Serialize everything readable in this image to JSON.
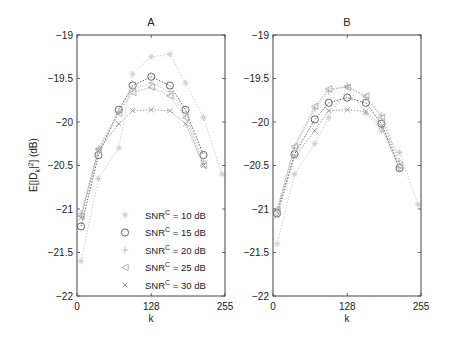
{
  "chart_data": [
    {
      "type": "line",
      "title": "A",
      "xlabel": "k",
      "ylabel": "E[|D_k|^2] (dB)",
      "xlim": [
        0,
        255
      ],
      "ylim": [
        -22,
        -19
      ],
      "xticks": [
        "0",
        "128",
        "255"
      ],
      "yticks": [
        "-19",
        "-19.5",
        "-20",
        "-20.5",
        "-21",
        "-21.5",
        "-22"
      ],
      "grid": false,
      "legend_position": "lower center",
      "series": [
        {
          "name": "SNR^C = 10 dB",
          "marker": "asterisk",
          "color": "#c8c8c8",
          "x": [
            7,
            37,
            72,
            96,
            128,
            160,
            187,
            218,
            250
          ],
          "y": [
            -21.6,
            -20.65,
            -20.3,
            -19.45,
            -19.25,
            -19.22,
            -19.55,
            -19.95,
            -20.6
          ]
        },
        {
          "name": "SNR^C = 15 dB",
          "marker": "circle",
          "color": "#555555",
          "x": [
            7,
            37,
            72,
            96,
            128,
            160,
            187,
            218
          ],
          "y": [
            -21.2,
            -20.38,
            -19.86,
            -19.58,
            -19.48,
            -19.58,
            -19.86,
            -20.38
          ]
        },
        {
          "name": "SNR^C = 20 dB",
          "marker": "plus",
          "color": "#bbbbbb",
          "x": [
            7,
            37,
            72,
            96,
            128,
            160,
            187,
            218
          ],
          "y": [
            -21.05,
            -20.3,
            -19.88,
            -19.62,
            -19.55,
            -19.65,
            -19.9,
            -20.45
          ]
        },
        {
          "name": "SNR^C = 25 dB",
          "marker": "triangle-left",
          "color": "#aaaaaa",
          "x": [
            7,
            37,
            72,
            96,
            128,
            160,
            187,
            218
          ],
          "y": [
            -21.08,
            -20.32,
            -19.9,
            -19.66,
            -19.6,
            -19.7,
            -19.95,
            -20.5
          ]
        },
        {
          "name": "SNR^C = 30 dB",
          "marker": "x",
          "color": "#999999",
          "x": [
            7,
            37,
            72,
            96,
            128,
            160,
            187,
            218
          ],
          "y": [
            -21.1,
            -20.33,
            -20.02,
            -19.87,
            -19.86,
            -19.87,
            -20.02,
            -20.5
          ]
        }
      ]
    },
    {
      "type": "line",
      "title": "B",
      "xlabel": "k",
      "ylabel": "",
      "xlim": [
        0,
        255
      ],
      "ylim": [
        -22,
        -19
      ],
      "xticks": [
        "0",
        "128",
        "255"
      ],
      "yticks": [
        "-19",
        "-19.5",
        "-20",
        "-20.5",
        "-21",
        "-21.5",
        "-22"
      ],
      "grid": false,
      "series": [
        {
          "name": "SNR^C = 10 dB",
          "marker": "asterisk",
          "color": "#c8c8c8",
          "x": [
            7,
            37,
            72,
            96,
            128,
            160,
            187,
            218,
            250
          ],
          "y": [
            -21.4,
            -20.6,
            -20.25,
            -19.95,
            -19.6,
            -19.9,
            -20.1,
            -20.35,
            -20.95
          ]
        },
        {
          "name": "SNR^C = 15 dB",
          "marker": "circle",
          "color": "#555555",
          "x": [
            7,
            37,
            72,
            96,
            128,
            160,
            187,
            218
          ],
          "y": [
            -21.05,
            -20.37,
            -19.97,
            -19.78,
            -19.72,
            -19.78,
            -20.02,
            -20.53
          ]
        },
        {
          "name": "SNR^C = 20 dB",
          "marker": "plus",
          "color": "#bbbbbb",
          "x": [
            7,
            37,
            72,
            96,
            128,
            160,
            187,
            218
          ],
          "y": [
            -21.0,
            -20.3,
            -19.85,
            -19.65,
            -19.58,
            -19.72,
            -19.92,
            -20.45
          ]
        },
        {
          "name": "SNR^C = 25 dB",
          "marker": "triangle-left",
          "color": "#aaaaaa",
          "x": [
            7,
            37,
            72,
            96,
            128,
            160,
            187,
            218
          ],
          "y": [
            -21.02,
            -20.28,
            -19.82,
            -19.62,
            -19.6,
            -19.7,
            -19.95,
            -20.5
          ]
        },
        {
          "name": "SNR^C = 30 dB",
          "marker": "x",
          "color": "#999999",
          "x": [
            7,
            37,
            72,
            96,
            128,
            160,
            187,
            218
          ],
          "y": [
            -21.08,
            -20.4,
            -20.1,
            -19.87,
            -19.86,
            -19.88,
            -20.05,
            -20.55
          ]
        }
      ]
    }
  ],
  "legend": {
    "items": [
      {
        "label_main": "SNR",
        "label_sup": "C",
        "label_rest": " = 10 dB"
      },
      {
        "label_main": "SNR",
        "label_sup": "C",
        "label_rest": " = 15 dB"
      },
      {
        "label_main": "SNR",
        "label_sup": "C",
        "label_rest": " = 20 dB"
      },
      {
        "label_main": "SNR",
        "label_sup": "C",
        "label_rest": " = 25 dB"
      },
      {
        "label_main": "SNR",
        "label_sup": "C",
        "label_rest": " = 30 dB"
      }
    ]
  },
  "axes": {
    "panel_a_title": "A",
    "panel_b_title": "B",
    "xlabel": "k",
    "ylabel_main": "E[|D",
    "ylabel_sub": "k",
    "ylabel_mid": "|",
    "ylabel_sup": "2",
    "ylabel_end": "] (dB)"
  }
}
